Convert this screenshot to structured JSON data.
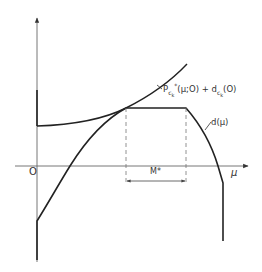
{
  "figure": {
    "type": "function-plot-diagram",
    "axes": {
      "origin_label": "O",
      "x_label": "μ",
      "y_label": ""
    },
    "curves": [
      {
        "id": "upper-curve",
        "label_main": "P",
        "label_sub": "c",
        "label_subsub": "k",
        "label_sup": "*",
        "label_args": "(μ;O) + d",
        "label_sub2": "c",
        "label_subsub2": "k",
        "label_args2": "(O)",
        "description": "convex increasing curve tangent to d(μ) at start of plateau"
      },
      {
        "id": "d-curve",
        "label": "d(μ)",
        "description": "concave piecewise curve with flat plateau of width M*"
      }
    ],
    "dimension": {
      "label": "M*",
      "description": "width of flat plateau between two dashed verticals"
    },
    "colors": {
      "background": "#ffffff",
      "line": "#222222",
      "axis": "#555555",
      "dashed": "#777777"
    }
  }
}
